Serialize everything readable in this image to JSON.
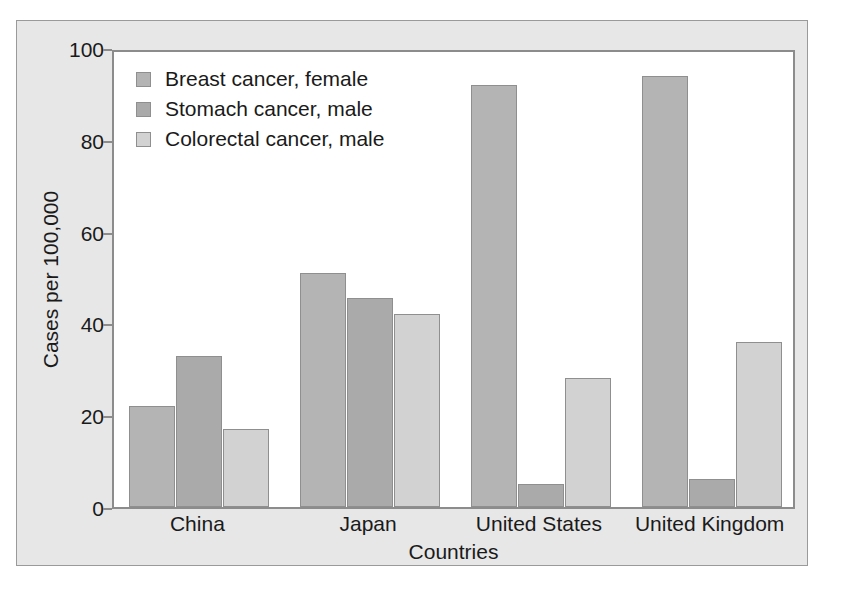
{
  "chart_data": {
    "type": "bar",
    "title": "",
    "xlabel": "Countries",
    "ylabel": "Cases per 100,000",
    "ylim": [
      0,
      100
    ],
    "yticks": [
      0,
      20,
      40,
      60,
      80,
      100
    ],
    "ytick_labels": [
      "0",
      "20",
      "40",
      "60",
      "80",
      "100"
    ],
    "grid": false,
    "legend_position": "top-left inside axes",
    "categories": [
      "China",
      "Japan",
      "United States",
      "United Kingdom"
    ],
    "series": [
      {
        "name": "Breast cancer, female",
        "color": "#b4b4b4",
        "values": [
          22,
          51,
          92,
          94
        ]
      },
      {
        "name": "Stomach cancer, male",
        "color": "#aaaaaa",
        "values": [
          33,
          45.5,
          5,
          6
        ]
      },
      {
        "name": "Colorectal cancer, male",
        "color": "#d2d2d2",
        "values": [
          17,
          42,
          28,
          36
        ]
      }
    ]
  },
  "figure": {
    "background": "#e7e7e7",
    "plot_background": "#ffffff",
    "axis_color": "#8c8c8c",
    "text_color": "#1a1a1a"
  }
}
